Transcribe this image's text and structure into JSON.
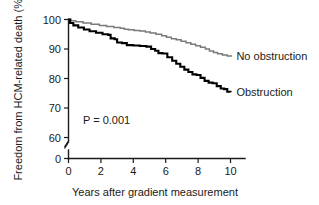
{
  "chart_data": {
    "type": "line",
    "title": "",
    "subtitle": "",
    "xlabel": "Years after gradient measurement",
    "ylabel": "Freedom from HCM-related death (%)",
    "xlim": [
      0,
      10.6
    ],
    "ylim": [
      58,
      101
    ],
    "grid": false,
    "legend_position": "inline-right-of-curves",
    "xticks": [
      0,
      2,
      4,
      6,
      8,
      10
    ],
    "xtick_labels": [
      "0",
      "2",
      "4",
      "6",
      "8",
      "10"
    ],
    "yticks": [
      60,
      70,
      80,
      90,
      100
    ],
    "ytick_labels": [
      "60",
      "70",
      "80",
      "90",
      "100"
    ],
    "axis_break": {
      "present": true,
      "between": [
        0,
        60
      ],
      "zero_label": "0"
    },
    "annotations": [
      {
        "name": "p-value",
        "text": "P = 0.001",
        "x": 1.3,
        "y": 64
      }
    ],
    "series": [
      {
        "name": "No obstruction",
        "color": "#7a7a7a",
        "label_x": 10.3,
        "label_y": 87.5,
        "step": "post",
        "x": [
          0,
          0.15,
          0.45,
          0.9,
          1.4,
          1.9,
          2.35,
          2.8,
          3.2,
          3.45,
          3.7,
          4.05,
          4.4,
          4.75,
          5.05,
          5.4,
          5.75,
          6.05,
          6.35,
          6.65,
          6.95,
          7.25,
          7.55,
          7.85,
          8.15,
          8.45,
          8.7,
          8.95,
          9.2,
          9.5,
          9.8,
          10.05
        ],
        "y": [
          100,
          99.6,
          99.2,
          98.8,
          98.4,
          98.0,
          97.6,
          97.3,
          97.0,
          96.7,
          96.5,
          96.3,
          96.1,
          95.8,
          95.4,
          95.0,
          94.5,
          94.0,
          93.5,
          93.1,
          92.6,
          92.1,
          91.6,
          91.1,
          90.6,
          90.0,
          89.3,
          88.8,
          88.4,
          88.0,
          87.6,
          87.4
        ]
      },
      {
        "name": "Obstruction",
        "color": "#000000",
        "label_x": 10.3,
        "label_y": 75.3,
        "step": "post",
        "x": [
          0,
          0.1,
          0.3,
          0.6,
          0.95,
          1.3,
          1.7,
          2.1,
          2.45,
          2.6,
          2.85,
          3.0,
          3.3,
          3.6,
          4.0,
          4.4,
          4.8,
          5.1,
          5.35,
          5.55,
          5.8,
          6.1,
          6.4,
          6.65,
          6.9,
          7.15,
          7.4,
          7.65,
          7.9,
          8.15,
          8.4,
          8.65,
          8.9,
          9.15,
          9.4,
          9.6,
          9.8,
          10.0
        ],
        "y": [
          100,
          98.8,
          98.0,
          97.3,
          96.6,
          96.0,
          95.5,
          95.0,
          94.8,
          93.6,
          93.3,
          92.2,
          92.0,
          91.3,
          91.2,
          91.0,
          90.8,
          90.0,
          89.4,
          88.6,
          88.5,
          87.2,
          86.0,
          85.0,
          84.0,
          83.0,
          82.2,
          81.4,
          81.2,
          80.2,
          79.2,
          78.6,
          78.4,
          77.4,
          76.6,
          76.4,
          75.5,
          75.3
        ]
      }
    ]
  },
  "axes": {
    "y_axis_label": "Freedom from HCM-related death (%)",
    "x_axis_label": "Years after gradient measurement",
    "y_zero_label": "0"
  },
  "labels": {
    "no_obstruction": "No obstruction",
    "obstruction": "Obstruction",
    "p_value": "P = 0.001"
  }
}
